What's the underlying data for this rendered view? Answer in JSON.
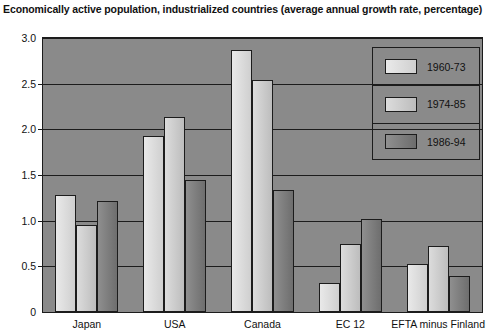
{
  "chart_data": {
    "type": "bar",
    "title": "Economically active population, industrialized countries (average  annual growth rate, percentage)",
    "xlabel": "",
    "ylabel": "",
    "ylim": [
      0,
      3.0
    ],
    "yticks": [
      "0",
      "0.5",
      "1.0",
      "1.5",
      "2.0",
      "2.5",
      "3.0"
    ],
    "ytick_values": [
      0,
      0.5,
      1.0,
      1.5,
      2.0,
      2.5,
      3.0
    ],
    "grid": true,
    "legend_position": "top-right",
    "categories": [
      "Japan",
      "USA",
      "Canada",
      "EC 12",
      "EFTA minus Finland"
    ],
    "series": [
      {
        "name": "1960-73",
        "color": "#d8d8d8",
        "values": [
          1.28,
          1.93,
          2.87,
          0.32,
          0.53
        ]
      },
      {
        "name": "1974-85",
        "color": "#c6c6c6",
        "values": [
          0.95,
          2.14,
          2.54,
          0.75,
          0.72
        ]
      },
      {
        "name": "1986-94",
        "color": "#7d7d7d",
        "values": [
          1.22,
          1.45,
          1.34,
          1.02,
          0.39
        ]
      }
    ],
    "plot_background": "#8a8a8a",
    "axis_color": "#1c1c1c"
  }
}
